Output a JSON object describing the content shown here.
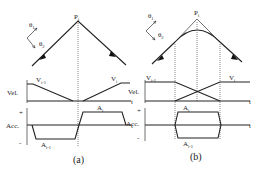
{
  "figure": {
    "panels": [
      {
        "id": "a",
        "caption": "(a)",
        "point_label": "P",
        "point_sub": "i",
        "theta1": "θ",
        "theta1_sub": "1",
        "theta2": "θ",
        "theta2_sub": "2",
        "vel_axis": "Vel.",
        "acc_axis": "Acc.",
        "time_label": "t",
        "plus": "+",
        "minus": "-",
        "v_prev": "V",
        "v_prev_sub": "i-1",
        "v_next": "V",
        "v_next_sub": "i",
        "a_prev": "A",
        "a_prev_sub": "i-1",
        "a_next": "A",
        "a_next_sub": "i"
      },
      {
        "id": "b",
        "caption": "(b)",
        "point_label": "P",
        "point_sub": "i",
        "theta1": "θ",
        "theta1_sub": "1",
        "theta2": "θ",
        "theta2_sub": "2",
        "vel_axis": "Vel.",
        "acc_axis": "Acc.",
        "time_label": "t",
        "plus": "+",
        "minus": "-",
        "v_prev": "V",
        "v_prev_sub": "i-1",
        "v_next": "V",
        "v_next_sub": "i",
        "a_prev": "A",
        "a_prev_sub": "i-1",
        "a_next": "A",
        "a_next_sub": "i"
      }
    ]
  }
}
